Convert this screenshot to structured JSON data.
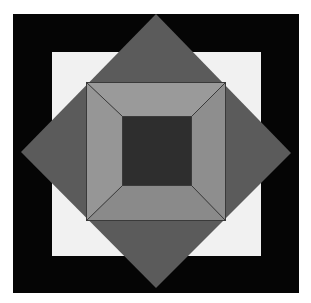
{
  "canvas": {
    "width": 311,
    "height": 303,
    "background_color": "#ffffff",
    "title": "Nested Geometric Composition"
  },
  "palette": {
    "page_background": "#ffffff",
    "outer_square": "#050505",
    "inner_light_square": "#f1f1f1",
    "diamond": "#5b5b5b",
    "frame_top": "#9a9a9a",
    "frame_left": "#969696",
    "frame_right": "#8e8e8e",
    "frame_bottom": "#8a8a8a",
    "center_square": "#2e2e2e",
    "outline": "#3a3a3a"
  },
  "shapes": {
    "outer_square": {
      "name": "black outer square",
      "x": 13,
      "y": 14,
      "width": 286,
      "height": 279,
      "fill": "#050505"
    },
    "inner_light_square": {
      "name": "off-white square",
      "x": 52,
      "y": 52,
      "width": 209,
      "height": 204,
      "fill": "#f1f1f1"
    },
    "diamond": {
      "name": "rotated dark gray square",
      "points": "156,14 291,153 156,288 21,152",
      "fill": "#5b5b5b",
      "center_x": 156,
      "center_y": 151
    },
    "frame": {
      "name": "gray beveled square frame",
      "outer": {
        "x": 86,
        "y": 82,
        "x2": 226,
        "y2": 221
      },
      "inner": {
        "x": 122,
        "y": 116,
        "x2": 192,
        "y2": 186
      },
      "facets": [
        {
          "name": "frame-facet-top",
          "points": "86,82 226,82 192,116 122,116",
          "fill": "#9a9a9a"
        },
        {
          "name": "frame-facet-left",
          "points": "86,82 122,116 122,186 86,221",
          "fill": "#969696"
        },
        {
          "name": "frame-facet-right",
          "points": "226,82 226,221 192,186 192,116",
          "fill": "#8e8e8e"
        },
        {
          "name": "frame-facet-bottom",
          "points": "86,221 122,186 192,186 226,221",
          "fill": "#8a8a8a"
        }
      ]
    },
    "center_square": {
      "name": "dark center square",
      "x": 122,
      "y": 116,
      "width": 70,
      "height": 70,
      "fill": "#2e2e2e"
    }
  },
  "edges": {
    "frame_outline_color": "#3a3a3a",
    "frame_outline_width": 1,
    "diagonal_lines": [
      "86,82 122,116",
      "226,82 192,116",
      "226,221 192,186",
      "86,221 122,186"
    ]
  },
  "caption": {
    "text": ""
  }
}
